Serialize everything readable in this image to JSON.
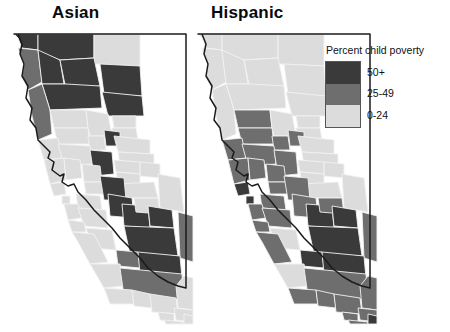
{
  "figure": {
    "background": "#ffffff",
    "panels": [
      {
        "id": "asian",
        "title": "Asian"
      },
      {
        "id": "hispanic",
        "title": "Hispanic"
      }
    ]
  },
  "legend": {
    "title": "Percent child poverty",
    "position": "top-right",
    "items": [
      {
        "label": "50+",
        "color": "#3a3a3a"
      },
      {
        "label": "25-49",
        "color": "#6e6e6e"
      },
      {
        "label": "0-24",
        "color": "#dcdcdc"
      }
    ]
  },
  "chart_data": {
    "type": "map",
    "title": "Percent child poverty",
    "subtitle": "",
    "xlabel": "",
    "ylabel": "",
    "region": "California counties",
    "grid": false,
    "legend_position": "top-right",
    "classes": [
      {
        "label": "50+",
        "min": 50,
        "max": 100,
        "color": "#3a3a3a"
      },
      {
        "label": "25-49",
        "min": 25,
        "max": 49,
        "color": "#6e6e6e"
      },
      {
        "label": "0-24",
        "min": 0,
        "max": 24,
        "color": "#dcdcdc"
      }
    ],
    "series": [
      {
        "name": "Asian",
        "values": [
          {
            "region": "Del Norte",
            "class": "50+"
          },
          {
            "region": "Siskiyou",
            "class": "50+"
          },
          {
            "region": "Modoc",
            "class": "0-24"
          },
          {
            "region": "Humboldt",
            "class": "25-49"
          },
          {
            "region": "Trinity",
            "class": "50+"
          },
          {
            "region": "Shasta",
            "class": "50+"
          },
          {
            "region": "Lassen",
            "class": "50+"
          },
          {
            "region": "Tehama",
            "class": "50+"
          },
          {
            "region": "Plumas",
            "class": "50+"
          },
          {
            "region": "Mendocino",
            "class": "25-49"
          },
          {
            "region": "Glenn",
            "class": "0-24"
          },
          {
            "region": "Butte",
            "class": "0-24"
          },
          {
            "region": "Sierra",
            "class": "0-24"
          },
          {
            "region": "Nevada",
            "class": "0-24"
          },
          {
            "region": "Colusa",
            "class": "0-24"
          },
          {
            "region": "Sutter",
            "class": "0-24"
          },
          {
            "region": "Yuba",
            "class": "50+"
          },
          {
            "region": "Placer",
            "class": "0-24"
          },
          {
            "region": "El Dorado",
            "class": "0-24"
          },
          {
            "region": "Lake",
            "class": "0-24"
          },
          {
            "region": "Yolo",
            "class": "0-24"
          },
          {
            "region": "Sacramento",
            "class": "50+"
          },
          {
            "region": "Amador",
            "class": "0-24"
          },
          {
            "region": "Alpine",
            "class": "0-24"
          },
          {
            "region": "Sonoma",
            "class": "0-24"
          },
          {
            "region": "Napa",
            "class": "0-24"
          },
          {
            "region": "Solano",
            "class": "0-24"
          },
          {
            "region": "Calaveras",
            "class": "0-24"
          },
          {
            "region": "Tuolumne",
            "class": "0-24"
          },
          {
            "region": "Mono",
            "class": "0-24"
          },
          {
            "region": "Marin",
            "class": "0-24"
          },
          {
            "region": "Contra Costa",
            "class": "0-24"
          },
          {
            "region": "San Joaquin",
            "class": "50+"
          },
          {
            "region": "Stanislaus",
            "class": "50+"
          },
          {
            "region": "San Francisco",
            "class": "0-24"
          },
          {
            "region": "Alameda",
            "class": "0-24"
          },
          {
            "region": "San Mateo",
            "class": "0-24"
          },
          {
            "region": "Santa Clara",
            "class": "0-24"
          },
          {
            "region": "Merced",
            "class": "50+"
          },
          {
            "region": "Mariposa",
            "class": "0-24"
          },
          {
            "region": "Madera",
            "class": "50+"
          },
          {
            "region": "Fresno",
            "class": "50+"
          },
          {
            "region": "Inyo",
            "class": "25-49"
          },
          {
            "region": "Santa Cruz",
            "class": "0-24"
          },
          {
            "region": "San Benito",
            "class": "0-24"
          },
          {
            "region": "Monterey",
            "class": "0-24"
          },
          {
            "region": "Kings",
            "class": "25-49"
          },
          {
            "region": "Tulare",
            "class": "50+"
          },
          {
            "region": "San Luis Obispo",
            "class": "0-24"
          },
          {
            "region": "Kern",
            "class": "25-49"
          },
          {
            "region": "Santa Barbara",
            "class": "0-24"
          },
          {
            "region": "Ventura",
            "class": "0-24"
          },
          {
            "region": "Los Angeles",
            "class": "0-24"
          },
          {
            "region": "San Bernardino",
            "class": "0-24"
          },
          {
            "region": "Orange",
            "class": "0-24"
          },
          {
            "region": "Riverside",
            "class": "0-24"
          },
          {
            "region": "San Diego",
            "class": "0-24"
          },
          {
            "region": "Imperial",
            "class": "0-24"
          }
        ]
      },
      {
        "name": "Hispanic",
        "values": [
          {
            "region": "Del Norte",
            "class": "0-24"
          },
          {
            "region": "Siskiyou",
            "class": "0-24"
          },
          {
            "region": "Modoc",
            "class": "0-24"
          },
          {
            "region": "Humboldt",
            "class": "0-24"
          },
          {
            "region": "Trinity",
            "class": "0-24"
          },
          {
            "region": "Shasta",
            "class": "0-24"
          },
          {
            "region": "Lassen",
            "class": "0-24"
          },
          {
            "region": "Tehama",
            "class": "0-24"
          },
          {
            "region": "Plumas",
            "class": "0-24"
          },
          {
            "region": "Mendocino",
            "class": "0-24"
          },
          {
            "region": "Glenn",
            "class": "25-49"
          },
          {
            "region": "Butte",
            "class": "0-24"
          },
          {
            "region": "Sierra",
            "class": "0-24"
          },
          {
            "region": "Nevada",
            "class": "0-24"
          },
          {
            "region": "Colusa",
            "class": "25-49"
          },
          {
            "region": "Sutter",
            "class": "25-49"
          },
          {
            "region": "Yuba",
            "class": "25-49"
          },
          {
            "region": "Placer",
            "class": "0-24"
          },
          {
            "region": "El Dorado",
            "class": "0-24"
          },
          {
            "region": "Lake",
            "class": "25-49"
          },
          {
            "region": "Yolo",
            "class": "25-49"
          },
          {
            "region": "Sacramento",
            "class": "25-49"
          },
          {
            "region": "Amador",
            "class": "0-24"
          },
          {
            "region": "Alpine",
            "class": "0-24"
          },
          {
            "region": "Sonoma",
            "class": "25-49"
          },
          {
            "region": "Napa",
            "class": "25-49"
          },
          {
            "region": "Solano",
            "class": "25-49"
          },
          {
            "region": "Calaveras",
            "class": "0-24"
          },
          {
            "region": "Tuolumne",
            "class": "0-24"
          },
          {
            "region": "Mono",
            "class": "0-24"
          },
          {
            "region": "Marin",
            "class": "50+"
          },
          {
            "region": "Contra Costa",
            "class": "25-49"
          },
          {
            "region": "San Joaquin",
            "class": "25-49"
          },
          {
            "region": "Stanislaus",
            "class": "25-49"
          },
          {
            "region": "San Francisco",
            "class": "50+"
          },
          {
            "region": "Alameda",
            "class": "25-49"
          },
          {
            "region": "San Mateo",
            "class": "25-49"
          },
          {
            "region": "Santa Clara",
            "class": "25-49"
          },
          {
            "region": "Merced",
            "class": "50+"
          },
          {
            "region": "Mariposa",
            "class": "25-49"
          },
          {
            "region": "Madera",
            "class": "50+"
          },
          {
            "region": "Fresno",
            "class": "50+"
          },
          {
            "region": "Inyo",
            "class": "25-49"
          },
          {
            "region": "Santa Cruz",
            "class": "25-49"
          },
          {
            "region": "San Benito",
            "class": "0-24"
          },
          {
            "region": "Monterey",
            "class": "25-49"
          },
          {
            "region": "Kings",
            "class": "50+"
          },
          {
            "region": "Tulare",
            "class": "50+"
          },
          {
            "region": "San Luis Obispo",
            "class": "0-24"
          },
          {
            "region": "Kern",
            "class": "25-49"
          },
          {
            "region": "Santa Barbara",
            "class": "25-49"
          },
          {
            "region": "Ventura",
            "class": "25-49"
          },
          {
            "region": "Los Angeles",
            "class": "25-49"
          },
          {
            "region": "San Bernardino",
            "class": "25-49"
          },
          {
            "region": "Orange",
            "class": "25-49"
          },
          {
            "region": "Riverside",
            "class": "25-49"
          },
          {
            "region": "San Diego",
            "class": "25-49"
          },
          {
            "region": "Imperial",
            "class": "50+"
          }
        ]
      }
    ]
  }
}
